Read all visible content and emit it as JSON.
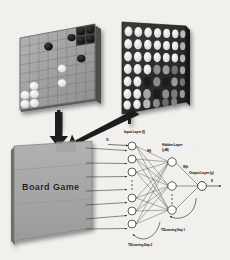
{
  "figure": {
    "panels": {
      "othello_board": {
        "name": "Othello board position",
        "grid_cols": 8,
        "grid_rows": 8,
        "black_discs": [
          {
            "col": 6,
            "row": 1
          },
          {
            "col": 7,
            "row": 1
          },
          {
            "col": 6,
            "row": 0
          },
          {
            "col": 7,
            "row": 0
          },
          {
            "col": 5,
            "row": 1
          },
          {
            "col": 3,
            "row": 2
          },
          {
            "col": 6,
            "row": 3
          }
        ],
        "white_discs": [
          {
            "col": 4,
            "row": 4
          },
          {
            "col": 1,
            "row": 5
          },
          {
            "col": 0,
            "row": 6
          },
          {
            "col": 1,
            "row": 6
          },
          {
            "col": 3,
            "row": 6
          },
          {
            "col": 0,
            "row": 7
          },
          {
            "col": 1,
            "row": 7
          }
        ]
      },
      "feature_map": {
        "name": "Encoded board feature map",
        "grid_cols": 7,
        "grid_rows": 7
      },
      "board_game_plane": {
        "label": "Board Game"
      }
    },
    "network": {
      "input_label": "Input Layer (I)",
      "hidden_label": "Hidden Layer",
      "hidden_sublabel": "(j,dB)",
      "output_label": "Output Layer (y)",
      "input_signal": "Xi",
      "output_signal": "E",
      "weight_input_hidden": "Wij",
      "weight_hidden_output": "Wjk",
      "input_nodes": 7,
      "hidden_nodes": 3,
      "output_nodes": 1
    },
    "annotations": {
      "td_step_1": "TDLearning Step 1",
      "td_step_2": "TDLearning Step 2"
    },
    "colors": {
      "board_face": "#9c9c9c",
      "board_edge": "#5a5a5a",
      "panel_dark": "#2a2a2a",
      "disc_black": "#111111",
      "disc_white": "#f4f4f2",
      "plane_face": "#a8a8a8",
      "arrow": "#1d1d1d",
      "background": "#f2f0ed"
    }
  }
}
